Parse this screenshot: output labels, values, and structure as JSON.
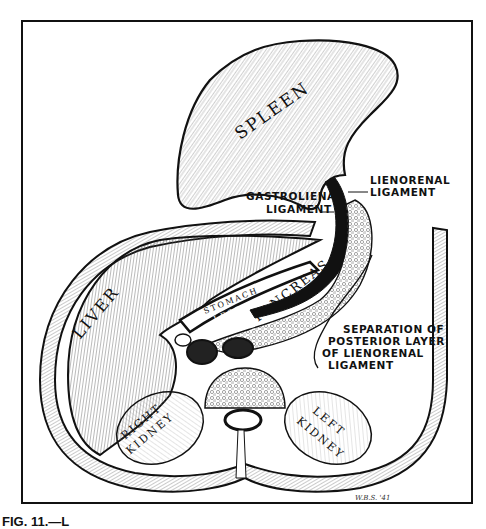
{
  "figure": {
    "signature": "W.B.S. '41",
    "caption": "FIG. 11.—L",
    "colors": {
      "ink": "#111111",
      "paper": "#ffffff",
      "hatch": "#555555",
      "shade": "#d8d8d8"
    }
  },
  "organs": {
    "spleen": "SPLEEN",
    "liver": "LIVER",
    "stomach": "STOMACH",
    "lesser_cavity": "LESSER CAVITY",
    "pancreas": "PANCREAS",
    "right_kidney_1": "RIGHT",
    "right_kidney_2": "KIDNEY",
    "left_kidney_1": "LEFT",
    "left_kidney_2": "KIDNEY"
  },
  "annotations": {
    "lienorenal_1": "LIENORENAL",
    "lienorenal_2": "LIGAMENT",
    "gastrolienal_1": "GASTROLIENAL",
    "gastrolienal_2": "LIGAMENT",
    "separation_1": "SEPARATION OF",
    "separation_2": "POSTERIOR LAYER",
    "separation_3": "OF LIENORENAL",
    "separation_4": "LIGAMENT"
  }
}
